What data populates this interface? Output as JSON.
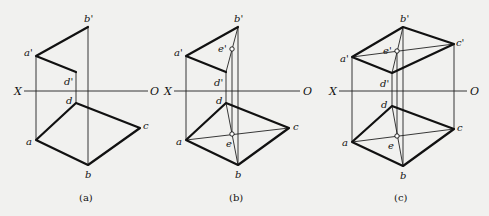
{
  "figure": {
    "axis": {
      "left_label": "X",
      "right_label": "O"
    },
    "panels": [
      {
        "caption": "(a)",
        "labels": {
          "b_prime": "b'",
          "a_prime": "a'",
          "d_prime": "d'",
          "d": "d",
          "a": "a",
          "b": "b",
          "c": "c"
        }
      },
      {
        "caption": "(b)",
        "labels": {
          "b_prime": "b'",
          "a_prime": "a'",
          "d_prime": "d'",
          "e_prime": "e'",
          "d": "d",
          "a": "a",
          "b": "b",
          "c": "c",
          "e": "e"
        }
      },
      {
        "caption": "(c)",
        "labels": {
          "b_prime": "b'",
          "a_prime": "a'",
          "c_prime": "c'",
          "d_prime": "d'",
          "e_prime": "e'",
          "d": "d",
          "a": "a",
          "b": "b",
          "c": "c",
          "e": "e"
        }
      }
    ]
  }
}
